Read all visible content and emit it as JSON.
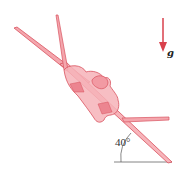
{
  "diagram": {
    "gravity_label": "g",
    "angle_label": "40°",
    "angle_degrees": 40,
    "colors": {
      "aircraft_fill": "#f4a6ad",
      "aircraft_stroke": "#d9525e",
      "gravity_arrow": "#d9404c",
      "reference_line": "#555555"
    }
  }
}
